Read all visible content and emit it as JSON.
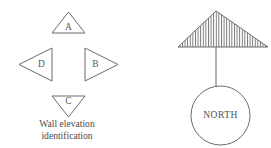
{
  "figure": {
    "background_color": "#ffffff",
    "line_color": "#6b6b6b",
    "text_color": "#4a4a4a"
  },
  "wall_elevation_symbol": {
    "caption_line_1": "Wall elevation",
    "caption_line_2": "identification",
    "markers": [
      {
        "label": "A",
        "direction": "up",
        "position": "top"
      },
      {
        "label": "B",
        "direction": "right",
        "position": "right"
      },
      {
        "label": "C",
        "direction": "down",
        "position": "bottom"
      },
      {
        "label": "D",
        "direction": "left",
        "position": "left"
      }
    ]
  },
  "north_arrow_symbol": {
    "label": "NORTH",
    "arrowhead": "hatched-triangle",
    "hatch_pattern": "vertical-lines",
    "stem": "vertical-line",
    "badge": "circle"
  }
}
